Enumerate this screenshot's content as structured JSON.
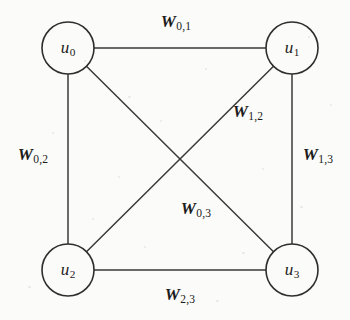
{
  "figure": {
    "kind": "weighted-undirected-graph",
    "background_color": "#fbfbf9",
    "stroke_color": "#3a3a3a",
    "text_color": "#1c1c1c",
    "width": 350,
    "height": 320
  },
  "nodes": [
    {
      "id": "u0",
      "label": "u",
      "sub": "0",
      "cx": 68,
      "cy": 48,
      "r": 26
    },
    {
      "id": "u1",
      "label": "u",
      "sub": "1",
      "cx": 292,
      "cy": 48,
      "r": 26
    },
    {
      "id": "u2",
      "label": "u",
      "sub": "2",
      "cx": 68,
      "cy": 270,
      "r": 26
    },
    {
      "id": "u3",
      "label": "u",
      "sub": "3",
      "cx": 292,
      "cy": 270,
      "r": 26
    }
  ],
  "edges": [
    {
      "id": "e01",
      "from": "u0",
      "to": "u1",
      "label": "W",
      "sub": "0,1",
      "label_x": 176,
      "label_y": 22
    },
    {
      "id": "e02",
      "from": "u0",
      "to": "u2",
      "label": "W",
      "sub": "0,2",
      "label_x": 33,
      "label_y": 155
    },
    {
      "id": "e12",
      "from": "u1",
      "to": "u2",
      "label": "W",
      "sub": "1,2",
      "label_x": 248,
      "label_y": 112
    },
    {
      "id": "e13",
      "from": "u1",
      "to": "u3",
      "label": "W",
      "sub": "1,3",
      "label_x": 318,
      "label_y": 155
    },
    {
      "id": "e03",
      "from": "u0",
      "to": "u3",
      "label": "W",
      "sub": "0,3",
      "label_x": 196,
      "label_y": 209
    },
    {
      "id": "e23",
      "from": "u2",
      "to": "u3",
      "label": "W",
      "sub": "2,3",
      "label_x": 180,
      "label_y": 295
    }
  ]
}
